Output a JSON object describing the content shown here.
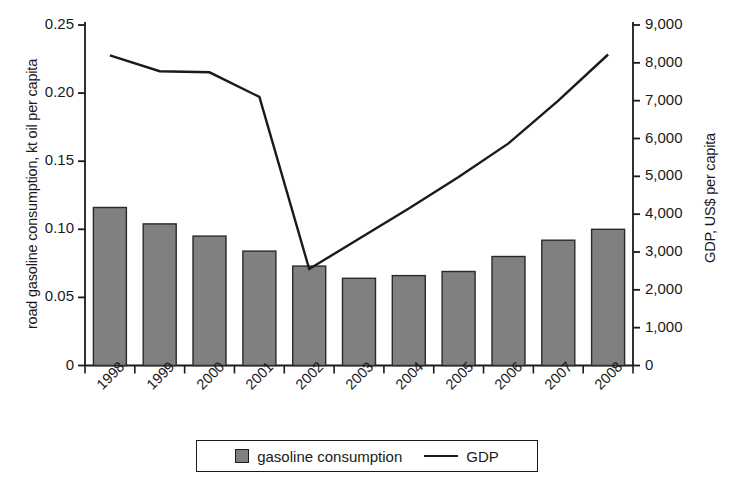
{
  "chart_data": {
    "type": "bar",
    "title": "",
    "categories": [
      "1998",
      "1999",
      "2000",
      "2001",
      "2002",
      "2003",
      "2004",
      "2005",
      "2006",
      "2007",
      "2008"
    ],
    "xlabel": "",
    "series": [
      {
        "name": "gasoline consumption",
        "type": "bar",
        "axis": "left",
        "color": "#808080",
        "values": [
          0.116,
          0.104,
          0.095,
          0.084,
          0.073,
          0.064,
          0.066,
          0.069,
          0.08,
          0.092,
          0.1
        ]
      },
      {
        "name": "GDP",
        "type": "line",
        "axis": "right",
        "color": "#1a1a1a",
        "values": [
          8200,
          7780,
          7750,
          7100,
          2550,
          3350,
          4150,
          4980,
          5870,
          7000,
          8220
        ]
      }
    ],
    "left_axis": {
      "label": "road gasoline consumption, kt oil per capita",
      "ylim": [
        0,
        0.25
      ],
      "ticks": [
        0,
        0.05,
        0.1,
        0.15,
        0.2,
        0.25
      ],
      "tick_labels": [
        "0",
        "0.05",
        "0.10",
        "0.15",
        "0.20",
        "0.25"
      ]
    },
    "right_axis": {
      "label": "GDP, US$ per capita",
      "ylim": [
        0,
        9000
      ],
      "ticks": [
        0,
        1000,
        2000,
        3000,
        4000,
        5000,
        6000,
        7000,
        8000,
        9000
      ],
      "tick_labels": [
        "0",
        "1,000",
        "2,000",
        "3,000",
        "4,000",
        "5,000",
        "6,000",
        "7,000",
        "8,000",
        "9,000"
      ]
    },
    "grid": false,
    "legend": {
      "position": "bottom",
      "entries": [
        {
          "label": "gasoline consumption",
          "marker": "square"
        },
        {
          "label": "GDP",
          "marker": "line"
        }
      ]
    }
  }
}
